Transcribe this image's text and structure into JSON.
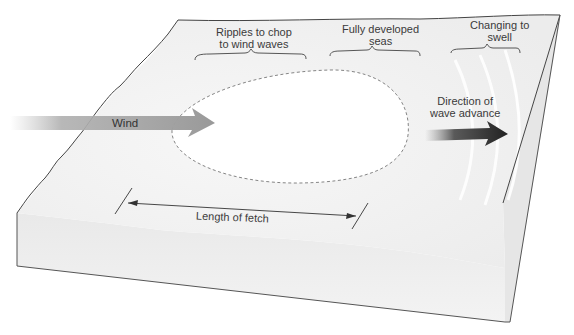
{
  "diagram": {
    "stages": [
      {
        "line1": "Ripples to chop",
        "line2": "to wind waves"
      },
      {
        "line1": "Fully developed",
        "line2": "seas"
      },
      {
        "line1": "Changing to",
        "line2": "swell"
      }
    ],
    "wind_label": "Wind",
    "direction_label": {
      "line1": "Direction of",
      "line2": "wave advance"
    },
    "fetch_label": "Length of fetch",
    "colors": {
      "surface": "#f2f2f2",
      "front_face": "#ebebeb",
      "side_face": "#e4e4e4",
      "outline": "#444444",
      "wind_arrow": "#9a9a9a",
      "wave_arrow": "#2b2b2b",
      "storm_area": "#ffffff",
      "dashed_outline": "#777777"
    }
  }
}
